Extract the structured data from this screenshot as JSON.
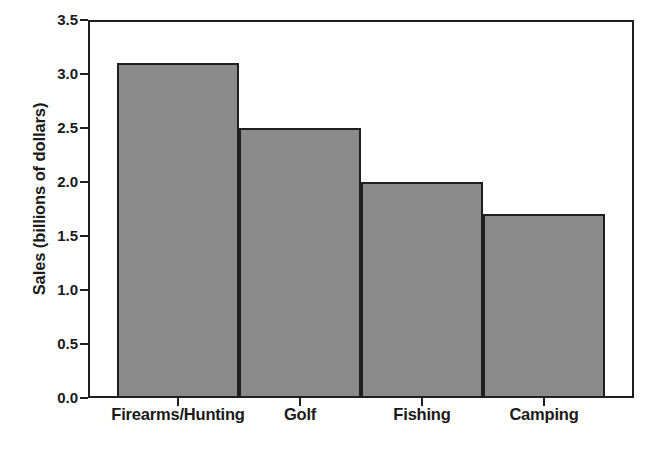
{
  "chart_data": {
    "type": "bar",
    "title": "",
    "subtitle": "",
    "xlabel": "",
    "ylabel": "Sales (billions of dollars)",
    "categories": [
      "Firearms/Hunting",
      "Golf",
      "Fishing",
      "Camping"
    ],
    "values": [
      3.1,
      2.5,
      2.0,
      1.7
    ],
    "series": [
      {
        "name": "Sales",
        "values": [
          3.1,
          2.5,
          2.0,
          1.7
        ]
      }
    ],
    "ylim": [
      0.0,
      3.5
    ],
    "y_ticks": [
      0.0,
      0.5,
      1.0,
      1.5,
      2.0,
      2.5,
      3.0,
      3.5
    ],
    "y_tick_labels": [
      "0.0",
      "0.5",
      "1.0",
      "1.5",
      "2.0",
      "2.5",
      "3.0",
      "3.5"
    ],
    "grid": false,
    "legend": "none",
    "bar_fill_color": "#8a8a8a",
    "bar_edge_color": "#1f1f1f",
    "background_color": "#ffffff",
    "axis_color": "#1f1f1f",
    "bar_gap": "none"
  }
}
